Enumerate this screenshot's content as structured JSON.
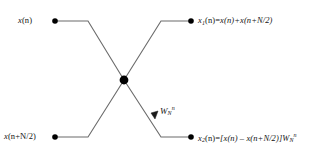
{
  "figure": {
    "type": "fft-butterfly-diagram",
    "title": "",
    "background_color": "#ffffff",
    "line_color": "#6b6b6b",
    "node_color": "#000000",
    "text_color": "#141414"
  },
  "nodes": [
    {
      "id": "in-top",
      "label": "input-top",
      "x": 55,
      "y": 21
    },
    {
      "id": "in-bottom",
      "label": "input-bottom",
      "x": 55,
      "y": 137
    },
    {
      "id": "center",
      "label": "butterfly-center",
      "x": 124,
      "y": 80
    },
    {
      "id": "out-top",
      "label": "output-top",
      "x": 191,
      "y": 21
    },
    {
      "id": "out-bottom",
      "label": "output-bottom",
      "x": 191,
      "y": 137
    }
  ],
  "labels": {
    "input_top": {
      "text": "x(n)",
      "parts": {
        "var": "x",
        "arg": "(n)"
      }
    },
    "input_bottom": {
      "text": "x(n+N/2)",
      "parts": {
        "var": "x",
        "arg": "(n+N/2)"
      }
    },
    "output_top": {
      "text": "x1(n)=x(n)+x(n+N/2)",
      "parts": {
        "var": "x",
        "sub": "1",
        "arg": "(n)",
        "eq": "=",
        "rhs": "x(n)+x(n+N/2)"
      }
    },
    "output_bottom": {
      "text": "x2(n)=[x(n) - x(n+N/2)]WNn",
      "parts": {
        "var": "x",
        "sub": "2",
        "arg": "(n)",
        "eq": "=",
        "rhs": "[x(n) – x(n+N/2)]",
        "twiddle_var": "W",
        "twiddle_sub": "N",
        "twiddle_sup": "n"
      }
    },
    "twiddle": {
      "text": "WNn",
      "parts": {
        "var": "W",
        "sub": "N",
        "sup": "n"
      }
    }
  },
  "edges": [
    {
      "name": "input-top-to-center",
      "from": "in-top",
      "to": "center",
      "has_arrow": false
    },
    {
      "name": "input-bottom-to-center",
      "from": "in-bottom",
      "to": "center",
      "has_arrow": false
    },
    {
      "name": "center-to-output-top",
      "from": "center",
      "to": "out-top",
      "has_arrow": false
    },
    {
      "name": "center-to-output-bottom",
      "from": "center",
      "to": "out-bottom",
      "has_arrow": true
    }
  ]
}
